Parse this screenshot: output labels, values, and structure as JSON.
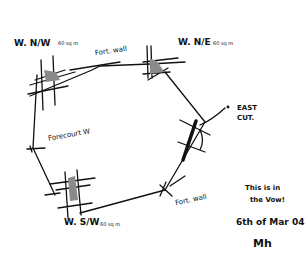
{
  "sketch": {
    "type": "hand-drawn architectural floor plan sketch (hexagonal enclosure with corner towers)",
    "ink_color": "#111111",
    "shade_color": "#8a8a8a",
    "background": "#ffffff"
  },
  "labels": {
    "nw_tower": "W. N/W",
    "nw_tower_note": "60 sq m",
    "north_wall": "Fort. wall",
    "ne_tower": "W. N/E",
    "ne_tower_note": "60 sq m",
    "east_cut": "EAST",
    "east_cut_2": "CUT.",
    "west_wall": "Forecourt W",
    "sw_tower": "W. S/W",
    "sw_tower_note": "60 sq m",
    "south_wall": "Fort. wall",
    "note_line1": "This is in",
    "note_line2": "the Vow!",
    "date": "6th of Mar 04",
    "signature": "Mh"
  }
}
